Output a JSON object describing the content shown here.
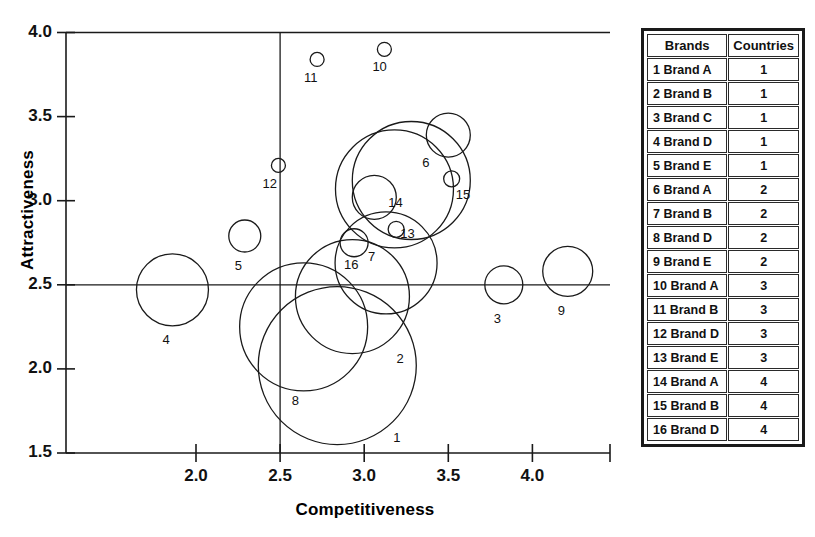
{
  "chart_data": {
    "type": "scatter",
    "variant": "bubble",
    "title": "",
    "xlabel": "Competitiveness",
    "ylabel": "Attractiveness",
    "xlim": [
      1.23,
      4.47
    ],
    "ylim": [
      1.5,
      4.0
    ],
    "xticks": [
      "2.0",
      "2.5",
      "3.0",
      "3.5",
      "4.0"
    ],
    "xtick_values": [
      2.0,
      2.5,
      3.0,
      3.5,
      4.0
    ],
    "yticks": [
      "1.5",
      "2.0",
      "2.5",
      "3.0",
      "3.5",
      "4.0"
    ],
    "ytick_values": [
      1.5,
      2.0,
      2.5,
      3.0,
      3.5,
      4.0
    ],
    "grid": false,
    "crosshair_x": 2.5,
    "crosshair_y": 2.5,
    "legend": "none",
    "size_note": "bubble radius proportional to market size",
    "points": [
      {
        "label": "1",
        "x": 2.84,
        "y": 2.02,
        "r": 79
      },
      {
        "label": "2",
        "x": 2.93,
        "y": 2.43,
        "r": 57
      },
      {
        "label": "3",
        "x": 3.83,
        "y": 2.5,
        "r": 19
      },
      {
        "label": "4",
        "x": 1.86,
        "y": 2.47,
        "r": 36
      },
      {
        "label": "5",
        "x": 2.29,
        "y": 2.79,
        "r": 16
      },
      {
        "label": "6",
        "x": 3.5,
        "y": 3.39,
        "r": 22
      },
      {
        "label": "7",
        "x": 3.13,
        "y": 2.63,
        "r": 51
      },
      {
        "label": "8",
        "x": 2.64,
        "y": 2.25,
        "r": 64
      },
      {
        "label": "9",
        "x": 4.21,
        "y": 2.58,
        "r": 25
      },
      {
        "label": "10",
        "x": 3.12,
        "y": 3.9,
        "r": 7
      },
      {
        "label": "11",
        "x": 2.72,
        "y": 3.84,
        "r": 7
      },
      {
        "label": "12",
        "x": 2.49,
        "y": 3.21,
        "r": 7
      },
      {
        "label": "13",
        "x": 3.19,
        "y": 2.83,
        "r": 8
      },
      {
        "label": "14",
        "x": 3.06,
        "y": 3.02,
        "r": 22
      },
      {
        "label": "15",
        "x": 3.52,
        "y": 3.13,
        "r": 8
      },
      {
        "label": "16",
        "x": 2.94,
        "y": 2.75,
        "r": 14
      },
      {
        "label": "17",
        "x": 3.18,
        "y": 3.07,
        "r": 59
      }
    ],
    "extra_bubbles": [
      {
        "ref": "6-outer",
        "x": 3.28,
        "y": 3.12,
        "r": 59
      }
    ]
  },
  "axis": {
    "x_title": "Competitiveness",
    "y_title": "Attractiveness"
  },
  "table": {
    "headers": [
      "Brands",
      "Countries"
    ],
    "rows": [
      {
        "brand": "1 Brand A",
        "countries": "1"
      },
      {
        "brand": "2 Brand B",
        "countries": "1"
      },
      {
        "brand": "3 Brand C",
        "countries": "1"
      },
      {
        "brand": "4 Brand D",
        "countries": "1"
      },
      {
        "brand": "5 Brand E",
        "countries": "1"
      },
      {
        "brand": "6 Brand A",
        "countries": "2"
      },
      {
        "brand": "7 Brand B",
        "countries": "2"
      },
      {
        "brand": "8 Brand D",
        "countries": "2"
      },
      {
        "brand": "9 Brand E",
        "countries": "2"
      },
      {
        "brand": "10 Brand A",
        "countries": "3"
      },
      {
        "brand": "11 Brand B",
        "countries": "3"
      },
      {
        "brand": "12 Brand D",
        "countries": "3"
      },
      {
        "brand": "13 Brand E",
        "countries": "3"
      },
      {
        "brand": "14 Brand A",
        "countries": "4"
      },
      {
        "brand": "15 Brand B",
        "countries": "4"
      },
      {
        "brand": "16 Brand D",
        "countries": "4"
      }
    ]
  },
  "colors": {
    "stroke": "#1a1a1a",
    "background": "#ffffff",
    "text": "#111111"
  }
}
